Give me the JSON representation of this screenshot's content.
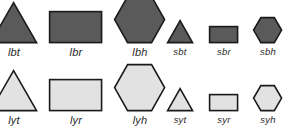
{
  "figure": {
    "background_color": "#ffffff",
    "stroke_color": "#1a1a1a",
    "dark_fill": "#5a5a5a",
    "light_fill": "#e2e2e2",
    "label_color": "#2a2a2a"
  },
  "groups": [
    {
      "id": "large-dark",
      "size": "large",
      "fill_name": "dark",
      "fill_color": "#5a5a5a",
      "items": [
        {
          "label": "lbt",
          "shape": "triangle",
          "width": 46,
          "height": 40
        },
        {
          "label": "lbr",
          "shape": "rectangle",
          "width": 52,
          "height": 31
        },
        {
          "label": "lbh",
          "shape": "hexagon",
          "width": 50,
          "height": 46
        }
      ]
    },
    {
      "id": "small-dark",
      "size": "small",
      "fill_name": "dark",
      "fill_color": "#5a5a5a",
      "items": [
        {
          "label": "sbt",
          "shape": "triangle",
          "width": 25,
          "height": 22
        },
        {
          "label": "sbr",
          "shape": "rectangle",
          "width": 28,
          "height": 16
        },
        {
          "label": "sbh",
          "shape": "hexagon",
          "width": 28,
          "height": 25
        }
      ]
    },
    {
      "id": "large-light",
      "size": "large",
      "fill_name": "light",
      "fill_color": "#e2e2e2",
      "items": [
        {
          "label": "lyt",
          "shape": "triangle",
          "width": 46,
          "height": 40
        },
        {
          "label": "lyr",
          "shape": "rectangle",
          "width": 52,
          "height": 31
        },
        {
          "label": "lyh",
          "shape": "hexagon",
          "width": 50,
          "height": 46
        }
      ]
    },
    {
      "id": "small-light",
      "size": "small",
      "fill_name": "light",
      "fill_color": "#e2e2e2",
      "items": [
        {
          "label": "syt",
          "shape": "triangle",
          "width": 25,
          "height": 22
        },
        {
          "label": "syr",
          "shape": "rectangle",
          "width": 28,
          "height": 16
        },
        {
          "label": "syh",
          "shape": "hexagon",
          "width": 28,
          "height": 25
        }
      ]
    }
  ],
  "layout": {
    "rows": [
      {
        "group_id": "large-dark",
        "baseline_y": 44,
        "x_positions": [
          14,
          76,
          140
        ]
      },
      {
        "group_id": "small-dark",
        "baseline_y": 44,
        "x_positions": [
          180,
          224,
          268
        ]
      },
      {
        "group_id": "large-light",
        "baseline_y": 112,
        "x_positions": [
          14,
          76,
          140
        ]
      },
      {
        "group_id": "small-light",
        "baseline_y": 112,
        "x_positions": [
          180,
          224,
          268
        ]
      }
    ]
  }
}
